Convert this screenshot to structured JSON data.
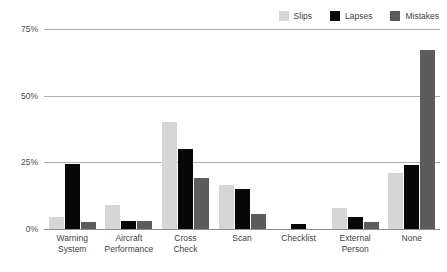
{
  "chart_data": {
    "type": "bar",
    "title": "",
    "subtitle": "",
    "xlabel": "",
    "ylabel": "",
    "ylim": [
      0,
      75
    ],
    "yticks": [
      0,
      25,
      50,
      75
    ],
    "ytick_labels": [
      "0%",
      "25%",
      "50%",
      "75%"
    ],
    "grid": true,
    "legend_position": "top-right",
    "categories": [
      "Warning System",
      "Aircraft Performance",
      "Cross Check",
      "Scan",
      "Checklist",
      "External Person",
      "None"
    ],
    "series": [
      {
        "name": "Slips",
        "color": "#d6d6d6",
        "values": [
          4.5,
          9,
          40,
          16.5,
          0,
          8,
          21
        ]
      },
      {
        "name": "Lapses",
        "color": "#080808",
        "values": [
          24.5,
          3,
          30,
          15,
          2,
          4.5,
          24
        ]
      },
      {
        "name": "Mistakes",
        "color": "#5c5c5c",
        "values": [
          2.5,
          3,
          19,
          5.5,
          0,
          2.5,
          67
        ]
      }
    ]
  },
  "legend": {
    "items": [
      {
        "label": "Slips",
        "color": "#d6d6d6"
      },
      {
        "label": "Lapses",
        "color": "#080808"
      },
      {
        "label": "Mistakes",
        "color": "#5c5c5c"
      }
    ]
  },
  "axis": {
    "y_ticks": [
      "75%",
      "50%",
      "25%",
      "0%"
    ],
    "x_labels": [
      {
        "line1": "Warning",
        "line2": "System"
      },
      {
        "line1": "Aircraft",
        "line2": "Performance"
      },
      {
        "line1": "Cross",
        "line2": "Check"
      },
      {
        "line1": "Scan",
        "line2": ""
      },
      {
        "line1": "Checklist",
        "line2": ""
      },
      {
        "line1": "External",
        "line2": "Person"
      },
      {
        "line1": "None",
        "line2": ""
      }
    ]
  }
}
